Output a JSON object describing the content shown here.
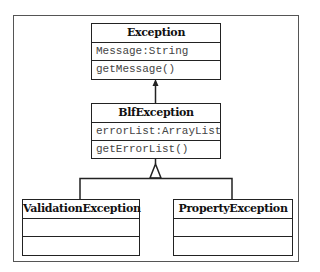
{
  "diagram": {
    "type": "UML class diagram",
    "classes": [
      {
        "name": "Exception",
        "attributes": [
          "Message:String"
        ],
        "methods": [
          "getMessage()"
        ]
      },
      {
        "name": "BlfException",
        "attributes": [
          "errorList:ArrayList"
        ],
        "methods": [
          "getErrorList()"
        ]
      },
      {
        "name": "ValidationException",
        "attributes": [
          ""
        ],
        "methods": [
          ""
        ]
      },
      {
        "name": "PropertyException",
        "attributes": [
          ""
        ],
        "methods": [
          ""
        ]
      }
    ],
    "relations": [
      {
        "from": "BlfException",
        "to": "Exception",
        "kind": "association-arrow"
      },
      {
        "from": "ValidationException",
        "to": "BlfException",
        "kind": "generalization"
      },
      {
        "from": "PropertyException",
        "to": "BlfException",
        "kind": "generalization"
      }
    ]
  }
}
